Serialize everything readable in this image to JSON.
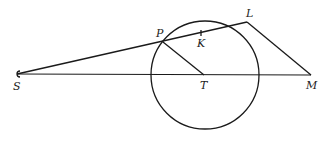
{
  "diagram": {
    "type": "geometry",
    "points": {
      "S": {
        "label": "S",
        "x": 17,
        "y": 74
      },
      "P": {
        "label": "P",
        "x": 163,
        "y": 42
      },
      "K": {
        "label": "K",
        "x": 201,
        "y": 33
      },
      "L": {
        "label": "L",
        "x": 247,
        "y": 22
      },
      "T": {
        "label": "T",
        "x": 204,
        "y": 75
      },
      "M": {
        "label": "M",
        "x": 311,
        "y": 75
      }
    },
    "circle": {
      "center": "T",
      "cx": 205,
      "cy": 75,
      "r": 54
    },
    "segments": [
      [
        "S",
        "L"
      ],
      [
        "S",
        "M"
      ],
      [
        "P",
        "T"
      ],
      [
        "L",
        "M"
      ]
    ],
    "colors": {
      "stroke": "#1a1a1a",
      "background": "#ffffff"
    }
  }
}
